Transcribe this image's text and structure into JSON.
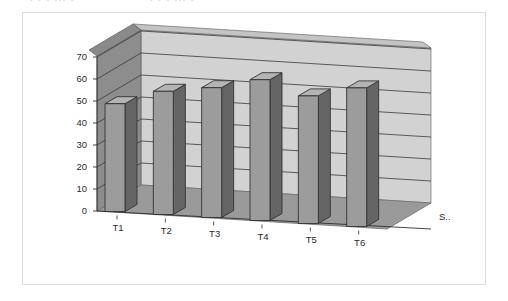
{
  "page": {
    "top_cut_text": ". .  .  ...        .",
    "frame": {
      "border_color": "#dcdcdc",
      "background": "#ffffff"
    }
  },
  "chart_data": {
    "type": "bar",
    "title": "",
    "subtitle": "",
    "xlabel": "",
    "ylabel": "",
    "categories": [
      "T1",
      "T2",
      "T3",
      "T4",
      "T5",
      "T6"
    ],
    "values": [
      49,
      56,
      59,
      64,
      58,
      63
    ],
    "series": [
      {
        "name": "S..",
        "values": [
          49,
          56,
          59,
          64,
          58,
          63
        ]
      }
    ],
    "ylim": [
      0,
      70
    ],
    "yticks": [
      0,
      10,
      20,
      30,
      40,
      50,
      60,
      70
    ],
    "ytick_labels": [
      "0",
      "10",
      "20",
      "30",
      "40",
      "50",
      "60",
      "70"
    ],
    "grid": true,
    "grid_axis": "y",
    "legend": false,
    "legend_position": "none",
    "series_axis_label": "S..",
    "render_style": "3d-column",
    "colors": {
      "bar_front": "#9c9c9c",
      "bar_side": "#656565",
      "bar_top": "#b4b4b4",
      "bar_outline": "#333333",
      "back_wall": "#d2d2d2",
      "left_wall": "#8d8d8d",
      "floor": "#9a9a9a",
      "gridline": "#3a3a3a",
      "tick_text": "#2b2b2b"
    }
  }
}
